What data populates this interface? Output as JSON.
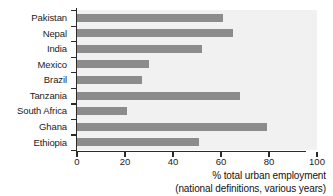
{
  "chart_data": {
    "type": "bar",
    "orientation": "horizontal",
    "title": "",
    "xlabel": "% total urban employment",
    "xlabel_line2": "(national definitions, various years)",
    "ylabel": "",
    "xlim": [
      0,
      100
    ],
    "xticks": [
      0,
      20,
      40,
      60,
      80,
      100
    ],
    "xtick_labels": [
      "0",
      "20",
      "40",
      "60",
      "80",
      "100"
    ],
    "grid": false,
    "legend": "none",
    "bar_color": "#8c8c8c",
    "plot_background": "#f1f1f1",
    "axis_color": "#2b2b2b",
    "categories": [
      "Pakistan",
      "Nepal",
      "India",
      "Mexico",
      "Brazil",
      "Tanzania",
      "South Africa",
      "Ghana",
      "Ethiopia"
    ],
    "values": [
      61,
      65,
      52,
      30,
      27,
      68,
      21,
      79,
      51
    ]
  },
  "axis": {
    "title_line1": "% total urban employment",
    "title_line2": "(national definitions, various years)"
  }
}
